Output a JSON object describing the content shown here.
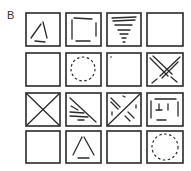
{
  "figure": {
    "label": "B",
    "grid": {
      "rows": 4,
      "cols": 4,
      "cells": [
        [
          "triangle-fragmented",
          "square-fragmented",
          "inverted-triangle-stripes",
          "empty"
        ],
        [
          "empty",
          "circle-dashed",
          "empty",
          "x-double-lines"
        ],
        [
          "x-diagonals",
          "diagonal-with-stripes",
          "x-with-fragments",
          "plus-fragmented"
        ],
        [
          "empty",
          "triangle-fragmented",
          "empty",
          "circle-dashed"
        ]
      ]
    }
  }
}
